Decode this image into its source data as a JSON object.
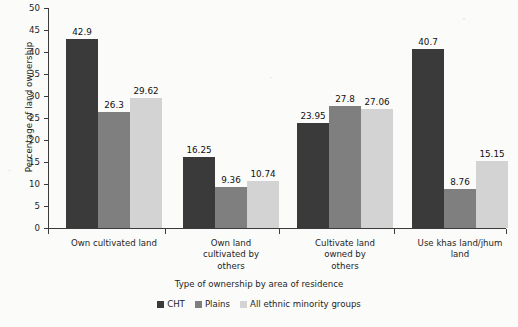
{
  "chart_data": {
    "type": "bar",
    "title": "",
    "xlabel": "Type of ownership by area of residence",
    "ylabel": "Percentage of land ownership",
    "ylim": [
      0,
      50
    ],
    "ytick_step": 5,
    "yticks": [
      "50",
      "45",
      "40",
      "35",
      "30",
      "25",
      "20",
      "15",
      "10",
      "5",
      "0"
    ],
    "grid": false,
    "legend_position": "bottom",
    "categories": [
      "Own cultivated land",
      "Own land cultivated by others",
      "Cultivate land owned by others",
      "Use khas land/jhum land"
    ],
    "category_lines": [
      [
        "Own cultivated land"
      ],
      [
        "Own land",
        "cultivated by",
        "others"
      ],
      [
        "Cultivate land",
        "owned by",
        "others"
      ],
      [
        "Use khas land/jhum",
        "land"
      ]
    ],
    "series": [
      {
        "name": "CHT",
        "color": "#3a3a3a",
        "values": [
          42.9,
          16.25,
          23.95,
          40.7
        ],
        "labels": [
          "42.9",
          "16.25",
          "23.95",
          "40.7"
        ]
      },
      {
        "name": "Plains",
        "color": "#7f7f7f",
        "values": [
          26.3,
          9.36,
          27.8,
          8.76
        ],
        "labels": [
          "26.3",
          "9.36",
          "27.8",
          "8.76"
        ]
      },
      {
        "name": "All ethnic minority groups",
        "color": "#d3d3d3",
        "values": [
          29.62,
          10.74,
          27.06,
          15.15
        ],
        "labels": [
          "29.62",
          "10.74",
          "27.06",
          "15.15"
        ]
      }
    ]
  },
  "colors": {
    "series_1": "#3a3a3a",
    "series_2": "#7f7f7f",
    "series_3": "#d3d3d3",
    "axis": "#3b3b3b",
    "background": "#fbfbf9",
    "text": "#1e1e1e"
  }
}
